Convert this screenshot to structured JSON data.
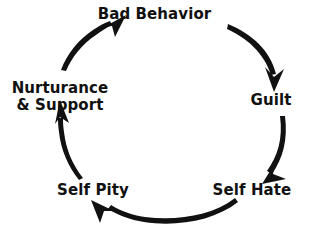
{
  "diagram": {
    "type": "cycle",
    "direction": "clockwise",
    "background_color": "#ffffff",
    "ink_color": "#111111",
    "nodes": [
      {
        "id": "bad-behavior",
        "label": "Bad Behavior",
        "position": "top"
      },
      {
        "id": "guilt",
        "label": "Guilt",
        "position": "right"
      },
      {
        "id": "self-hate",
        "label": "Self Hate",
        "position": "bottom-right"
      },
      {
        "id": "self-pity",
        "label": "Self Pity",
        "position": "bottom-left"
      },
      {
        "id": "nurturance",
        "label_line_1": "Nurturance",
        "label_line_2": "& Support",
        "position": "left"
      }
    ],
    "arrows": [
      {
        "id": "arrow-bad-behavior-to-guilt",
        "from": "bad-behavior",
        "to": "guilt"
      },
      {
        "id": "arrow-guilt-to-self-hate",
        "from": "guilt",
        "to": "self-hate"
      },
      {
        "id": "arrow-self-hate-to-self-pity",
        "from": "self-hate",
        "to": "self-pity"
      },
      {
        "id": "arrow-self-pity-to-nurturance",
        "from": "self-pity",
        "to": "nurturance"
      },
      {
        "id": "arrow-nurturance-to-bad-behavior",
        "from": "nurturance",
        "to": "bad-behavior"
      }
    ]
  }
}
